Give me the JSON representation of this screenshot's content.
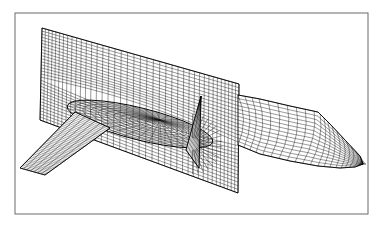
{
  "figure": {
    "frame": {
      "x": 15,
      "y": 13,
      "width": 353,
      "height": 201,
      "color": "#6a6a6a"
    },
    "colors": {
      "background": "#ffffff",
      "mesh": "#1a1a1a",
      "outline": "#000000"
    },
    "components": [
      {
        "name": "grid-plane",
        "label": "Vertical grid plane",
        "corners": [
          [
            42,
            28
          ],
          [
            239,
            84
          ],
          [
            238,
            193
          ],
          [
            40,
            120
          ]
        ],
        "u_lines": 40,
        "v_lines": 30
      },
      {
        "name": "fuselage",
        "label": "Fuselage",
        "top": [
          [
            238,
            95
          ],
          [
            260,
            99
          ],
          [
            290,
            106
          ],
          [
            318,
            112
          ],
          [
            330,
            124
          ],
          [
            345,
            140
          ],
          [
            360,
            156
          ],
          [
            363,
            164
          ]
        ],
        "bottom": [
          [
            238,
            145
          ],
          [
            260,
            154
          ],
          [
            290,
            161
          ],
          [
            318,
            166
          ],
          [
            340,
            168
          ],
          [
            355,
            167
          ],
          [
            363,
            164
          ]
        ],
        "u_lines": 22,
        "v_lines": 14
      },
      {
        "name": "wing",
        "label": "Wing",
        "root_le": [
          75,
          112
        ],
        "root_te": [
          110,
          128
        ],
        "tip_le": [
          20,
          168
        ],
        "tip_te": [
          45,
          175
        ],
        "u_lines": 40,
        "v_lines": 7
      },
      {
        "name": "fin",
        "label": "Vertical tail fin",
        "apex": [
          201,
          96
        ],
        "base_front": [
          186,
          150
        ],
        "base_back": [
          199,
          168
        ],
        "u_lines": 14,
        "v_lines": 10
      },
      {
        "name": "body-inside-plane",
        "label": "Fuselage section inside grid plane",
        "center": [
          140,
          124
        ],
        "rx": 75,
        "ry": 16,
        "rings": 12
      }
    ]
  }
}
